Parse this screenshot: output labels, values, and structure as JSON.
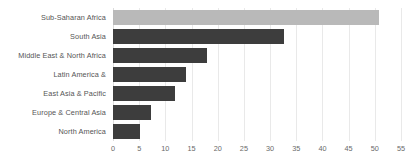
{
  "chart_data": {
    "type": "bar",
    "orientation": "horizontal",
    "title": "",
    "subtitle": "",
    "xlabel": "",
    "ylabel": "",
    "categories": [
      "Sub-Saharan Africa",
      "South Asia",
      "Middle East & North Africa",
      "Latin America &",
      "East Asia & Pacific",
      "Europe & Central Asia",
      "North America"
    ],
    "values": [
      50.8,
      32.6,
      18.0,
      14.0,
      11.9,
      7.3,
      5.2
    ],
    "series": [
      {
        "name": "",
        "values": [
          50.8,
          32.6,
          18.0,
          14.0,
          11.9,
          7.3,
          5.2
        ]
      }
    ],
    "xlim": [
      0,
      55
    ],
    "xticks": [
      0,
      5,
      10,
      15,
      20,
      25,
      30,
      35,
      40,
      45,
      50,
      55
    ],
    "xtick_labels": [
      "0",
      "5",
      "10",
      "15",
      "20",
      "25",
      "30",
      "35",
      "40",
      "45",
      "50",
      "55"
    ],
    "grid": true,
    "grid_axis": "x",
    "legend": false,
    "legend_position": "none",
    "highlight_category": "Sub-Saharan Africa",
    "colors": {
      "bar": "#3d3d3d",
      "bar_highlight": "#b9b9b9",
      "gridline": "#e9e9e9",
      "axis": "#dcdcdc",
      "category_label": "#555555",
      "tick_label": "#6a6a6a",
      "background": "#ffffff"
    }
  }
}
